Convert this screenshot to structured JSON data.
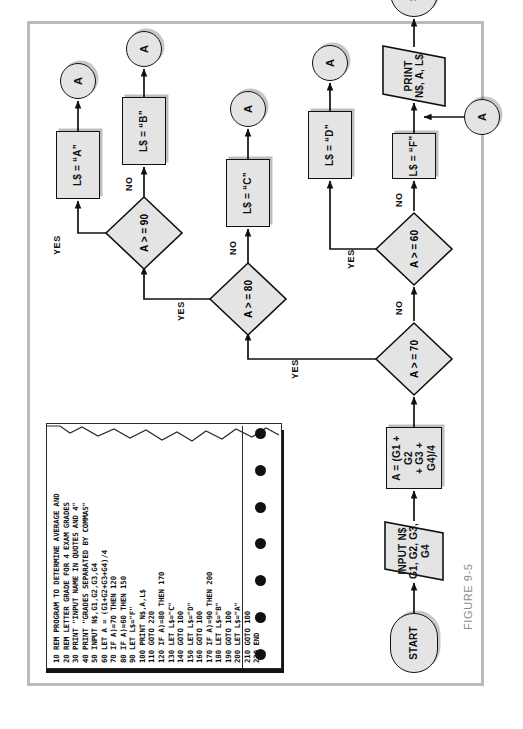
{
  "figure": {
    "caption": "FIGURE 9-5",
    "border_color": "#b9bcbe",
    "node_fill": "#e4e4e4",
    "ink": "#111111"
  },
  "flowchart": {
    "type": "program-flowchart",
    "nodes": [
      {
        "id": "start",
        "shape": "terminal",
        "label": "START"
      },
      {
        "id": "input",
        "shape": "io",
        "label": "INPUT N$\nG1, G2, G3, G4"
      },
      {
        "id": "average",
        "shape": "process",
        "label": "A = (G1 + G2\n+ G3 + G4)/4"
      },
      {
        "id": "d70",
        "shape": "decision",
        "label": "A > = 70"
      },
      {
        "id": "d60",
        "shape": "decision",
        "label": "A > = 60"
      },
      {
        "id": "d80",
        "shape": "decision",
        "label": "A > = 80"
      },
      {
        "id": "d90",
        "shape": "decision",
        "label": "A > = 90"
      },
      {
        "id": "grade_a",
        "shape": "process",
        "label": "L$ = “A”"
      },
      {
        "id": "grade_b",
        "shape": "process",
        "label": "L$ = “B”"
      },
      {
        "id": "grade_c",
        "shape": "process",
        "label": "L$ = “C”"
      },
      {
        "id": "grade_d",
        "shape": "process",
        "label": "L$ = “D”"
      },
      {
        "id": "grade_f",
        "shape": "process",
        "label": "L$ = “F”"
      },
      {
        "id": "conn_a1",
        "shape": "connector",
        "label": "A"
      },
      {
        "id": "conn_a2",
        "shape": "connector",
        "label": "A"
      },
      {
        "id": "conn_a3",
        "shape": "connector",
        "label": "A"
      },
      {
        "id": "conn_a4",
        "shape": "connector",
        "label": "A"
      },
      {
        "id": "conn_in",
        "shape": "connector",
        "label": "A"
      },
      {
        "id": "print",
        "shape": "io",
        "label": "PRINT\nN$, A, L$"
      },
      {
        "id": "stop",
        "shape": "terminal",
        "label": "STOP"
      }
    ],
    "edge_labels": {
      "yes70": "YES",
      "no70": "NO",
      "yes60": "YES",
      "no60": "NO",
      "yes80": "YES",
      "no80": "NO",
      "yes90": "YES",
      "no90": "NO"
    }
  },
  "printout": {
    "title": "BASIC program listing on tractor-feed paper",
    "sprocket_count": 7,
    "lines": [
      "10 REM PROGRAM TO DETERMINE AVERAGE AND",
      "20 REM LETTER GRADE FOR 4 EXAM GRADES",
      "30 PRINT \"INPUT NAME IN QUOTES AND 4\"",
      "40 PRINT \"GRADES SEPARATED BY COMMAS\"",
      "50 INPUT N$,G1,G2,G3,G4",
      "60 LET A = (G1+G2+G3+G4)/4",
      "70 IF A)=70 THEN 120",
      "80 IF A)=60 THEN 150",
      "90 LET L$=\"F\"",
      "100 PRINT N$,A,L$",
      "110 GOTO 220",
      "120 IF A)=80 THEN 170",
      "130 LET L$=\"C\"",
      "140 GOTO 100",
      "150 LET L$=\"D\"",
      "160 GOTO 100",
      "170 IF A)=90 THEN 200",
      "180 LET L$=\"B\"",
      "190 GOTO 100",
      "200 LET L$=\"A\"",
      "210 GOTO 100",
      "220 END"
    ]
  }
}
